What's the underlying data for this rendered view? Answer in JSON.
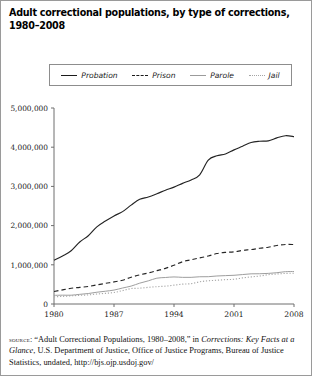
{
  "title": {
    "line1": "Adult correctional populations, by type of corrections,",
    "line2": "1980–2008"
  },
  "legend": {
    "items": [
      {
        "label": "Probation",
        "style": "solid",
        "color": "#242424"
      },
      {
        "label": "Prison",
        "style": "dashed",
        "color": "#262626"
      },
      {
        "label": "Parole",
        "style": "solid",
        "color": "#9e9e9e"
      },
      {
        "label": "Jail",
        "style": "dotted",
        "color": "#a8a8a8"
      }
    ]
  },
  "source": {
    "label": "source",
    "text_part1": ": “Adult Correctional Populations, 1980–2008,” in ",
    "italic1": "Corrections:",
    "italic2": "Key Facts at a Glance",
    "text_part2": ", U.S. Department of Justice, Office of Justice Programs, Bureau of Justice Statistics, undated, http://bjs.ojp.usdoj.gov/"
  },
  "chart_data": {
    "type": "line",
    "title": "Adult correctional populations, by type of corrections, 1980–2008",
    "xlabel": "",
    "ylabel": "",
    "xlim": [
      1980,
      2008
    ],
    "ylim": [
      0,
      5000000
    ],
    "ytick_labels": [
      "0",
      "1,000,000",
      "2,000,000",
      "3,000,000",
      "4,000,000",
      "5,000,000"
    ],
    "ytick_values": [
      0,
      1000000,
      2000000,
      3000000,
      4000000,
      5000000
    ],
    "xtick_labels": [
      "1980",
      "1987",
      "1994",
      "2001",
      "2008"
    ],
    "xtick_values": [
      1980,
      1987,
      1994,
      2001,
      2008
    ],
    "grid": false,
    "legend_position": "top",
    "x": [
      1980,
      1981,
      1982,
      1983,
      1984,
      1985,
      1986,
      1987,
      1988,
      1989,
      1990,
      1991,
      1992,
      1993,
      1994,
      1995,
      1996,
      1997,
      1998,
      1999,
      2000,
      2001,
      2002,
      2003,
      2004,
      2005,
      2006,
      2007,
      2008
    ],
    "series": [
      {
        "name": "Probation",
        "values": [
          1118097,
          1225934,
          1357264,
          1582947,
          1740948,
          1968712,
          2114621,
          2247158,
          2356483,
          2522125,
          2670234,
          2728472,
          2811611,
          2903061,
          2981022,
          3077861,
          3164996,
          3296513,
          3670441,
          3779922,
          3826209,
          3931731,
          4024067,
          4120012,
          4151125,
          4162536,
          4236800,
          4293163,
          4270917
        ]
      },
      {
        "name": "Prison",
        "values": [
          319598,
          360029,
          402914,
          423898,
          448264,
          487593,
          526436,
          562814,
          607766,
          683367,
          743382,
          792535,
          850566,
          909381,
          990147,
          1078542,
          1127528,
          1176564,
          1224469,
          1287172,
          1316333,
          1330007,
          1367547,
          1390279,
          1421345,
          1448344,
          1492973,
          1517867,
          1518559
        ]
      },
      {
        "name": "Parole",
        "values": [
          220438,
          225539,
          224604,
          246440,
          266992,
          300203,
          325638,
          355505,
          407977,
          456803,
          531407,
          590442,
          658601,
          676100,
          690371,
          679421,
          679733,
          694787,
          696385,
          714457,
          723898,
          732333,
          750934,
          769925,
          771852,
          780616,
          798202,
          824365,
          828169
        ]
      },
      {
        "name": "Jail",
        "values": [
          182288,
          195085,
          207853,
          221815,
          233018,
          254986,
          272736,
          294092,
          341893,
          393303,
          403019,
          424129,
          441781,
          455500,
          479800,
          507044,
          518492,
          567079,
          592462,
          605943,
          621149,
          631240,
          665475,
          691301,
          713990,
          747529,
          765819,
          780174,
          785556
        ]
      }
    ]
  }
}
